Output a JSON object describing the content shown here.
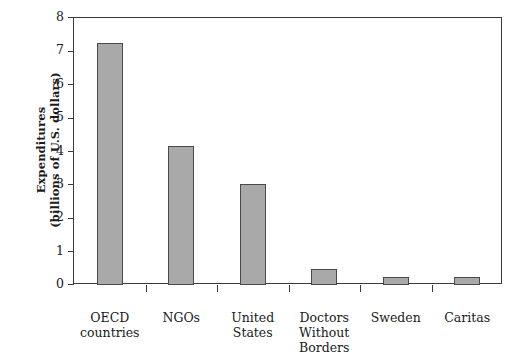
{
  "chart_data": {
    "type": "bar",
    "title": "",
    "subtitle": "",
    "xlabel": "",
    "ylabel": "Expenditures\n(billions of U.S. dollars)",
    "ylim": [
      0,
      8
    ],
    "yticks": [
      "0",
      "1",
      "2",
      "3",
      "4",
      "5",
      "6",
      "7",
      "8"
    ],
    "ytick_values": [
      0,
      1,
      2,
      3,
      4,
      5,
      6,
      7,
      8
    ],
    "grid": false,
    "legend": null,
    "bar_color": "#a9a9a9",
    "bar_edge_color": "#4a4a4a",
    "axis_color": "#3a3a3a",
    "categories": [
      "OECD\ncountries",
      "NGOs",
      "United\nStates",
      "Doctors\nWithout\nBorders",
      "Sweden",
      "Caritas"
    ],
    "values": [
      7.25,
      4.15,
      3.02,
      0.48,
      0.24,
      0.24
    ]
  }
}
